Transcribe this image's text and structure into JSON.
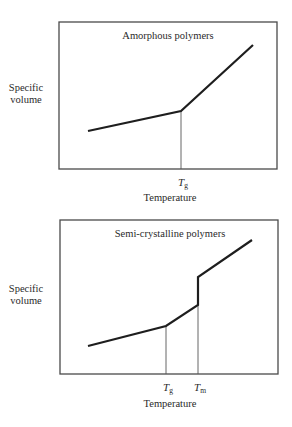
{
  "colors": {
    "frame": "#4a4a4a",
    "curve": "#1e1e1e",
    "guide": "#555555",
    "text": "#2a2a2a"
  },
  "panels": [
    {
      "title": "Amorphous polymers",
      "ylabel_line1": "Specific",
      "ylabel_line2": "volume",
      "xlabel": "Temperature",
      "ticks": [
        {
          "symbol": "T",
          "sub": "g",
          "x": 181
        }
      ],
      "frame": {
        "x": 59,
        "y": 22,
        "w": 218,
        "h": 147
      },
      "curve": [
        [
          88,
          131
        ],
        [
          181,
          111
        ],
        [
          253,
          45
        ]
      ],
      "guides": [
        {
          "x": 181,
          "y1": 111,
          "y2": 169
        }
      ],
      "layout": {
        "top": 0,
        "title_x": 168,
        "title_y": 30,
        "ylabel_y": 82,
        "tick_y": 176,
        "xlabel_y": 192
      }
    },
    {
      "title": "Semi-crystalline polymers",
      "ylabel_line1": "Specific",
      "ylabel_line2": "volume",
      "xlabel": "Temperature",
      "ticks": [
        {
          "symbol": "T",
          "sub": "g",
          "x": 166
        },
        {
          "symbol": "T",
          "sub": "m",
          "x": 198
        }
      ],
      "frame": {
        "x": 60,
        "y": 10,
        "w": 218,
        "h": 154
      },
      "curve": [
        [
          88,
          136
        ],
        [
          166,
          116
        ],
        [
          198,
          95
        ],
        [
          198,
          67
        ],
        [
          252,
          30
        ]
      ],
      "guides": [
        {
          "x": 166,
          "y1": 116,
          "y2": 164
        },
        {
          "x": 198,
          "y1": 95,
          "y2": 164
        }
      ],
      "layout": {
        "top": 210,
        "title_x": 170,
        "title_y": 18,
        "ylabel_y": 73,
        "tick_y": 171,
        "xlabel_y": 188
      }
    }
  ],
  "chart_data": [
    {
      "type": "line",
      "title": "Amorphous polymers",
      "xlabel": "Temperature",
      "ylabel": "Specific volume",
      "x_markers": [
        "Tg"
      ],
      "segments": [
        {
          "from": "low T",
          "to": "Tg",
          "slope": "low"
        },
        {
          "from": "Tg",
          "to": "high T",
          "slope": "high"
        }
      ],
      "grid": false
    },
    {
      "type": "line",
      "title": "Semi-crystalline polymers",
      "xlabel": "Temperature",
      "ylabel": "Specific volume",
      "x_markers": [
        "Tg",
        "Tm"
      ],
      "segments": [
        {
          "from": "low T",
          "to": "Tg",
          "slope": "low"
        },
        {
          "from": "Tg",
          "to": "Tm",
          "slope": "medium"
        },
        {
          "at": "Tm",
          "type": "vertical jump"
        },
        {
          "from": "Tm",
          "to": "high T",
          "slope": "high"
        }
      ],
      "grid": false
    }
  ]
}
